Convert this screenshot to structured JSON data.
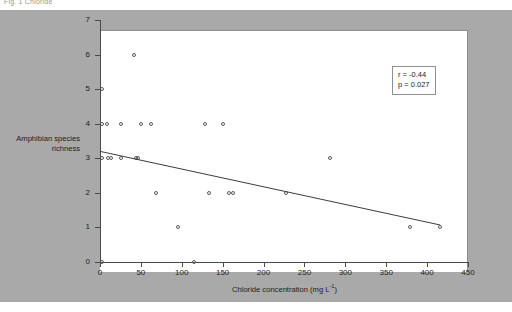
{
  "caption": "Fig. 1  Chloride",
  "chart_data": {
    "type": "scatter",
    "title": "",
    "xlabel": "Chloride concentration (mg L-1)",
    "xlabel_main": "Chloride concentration (mg L",
    "xlabel_sup": "-1",
    "xlabel_tail": ")",
    "ylabel_line1": "Amphibian species",
    "ylabel_line2": "richness",
    "ylabel": "Amphibian species richness",
    "xlim": [
      0,
      450
    ],
    "ylim": [
      0,
      7
    ],
    "xticks": [
      0,
      50,
      100,
      150,
      200,
      250,
      300,
      350,
      400,
      450
    ],
    "yticks": [
      0,
      1,
      2,
      3,
      4,
      5,
      6,
      7
    ],
    "grid": false,
    "legend": "none",
    "marker": "open-circle",
    "points": [
      {
        "x": 2,
        "y": 5
      },
      {
        "x": 2,
        "y": 4
      },
      {
        "x": 2,
        "y": 3
      },
      {
        "x": 2,
        "y": 0
      },
      {
        "x": 8,
        "y": 4
      },
      {
        "x": 10,
        "y": 3
      },
      {
        "x": 14,
        "y": 3
      },
      {
        "x": 26,
        "y": 4
      },
      {
        "x": 26,
        "y": 3
      },
      {
        "x": 42,
        "y": 6
      },
      {
        "x": 44,
        "y": 3
      },
      {
        "x": 47,
        "y": 3
      },
      {
        "x": 50,
        "y": 4
      },
      {
        "x": 62,
        "y": 4
      },
      {
        "x": 68,
        "y": 2
      },
      {
        "x": 95,
        "y": 1
      },
      {
        "x": 115,
        "y": 0
      },
      {
        "x": 128,
        "y": 4
      },
      {
        "x": 133,
        "y": 2
      },
      {
        "x": 150,
        "y": 4
      },
      {
        "x": 158,
        "y": 2
      },
      {
        "x": 163,
        "y": 2
      },
      {
        "x": 228,
        "y": 2
      },
      {
        "x": 281,
        "y": 3
      },
      {
        "x": 379,
        "y": 1
      },
      {
        "x": 416,
        "y": 1
      }
    ],
    "trendline": {
      "x_start": 0,
      "y_start": 3.2,
      "x_end": 416,
      "y_end": 1.07,
      "color": "#3c3c3c"
    },
    "annotation": {
      "r_label": "r = -0.44",
      "p_label": "p = 0.027"
    }
  },
  "colors": {
    "panel_background": "#a9a9a9",
    "plot_background": "#ffffff",
    "axis": "#4a4a4a",
    "marker_stroke": "#5a5a5a",
    "trendline": "#3c3c3c"
  }
}
